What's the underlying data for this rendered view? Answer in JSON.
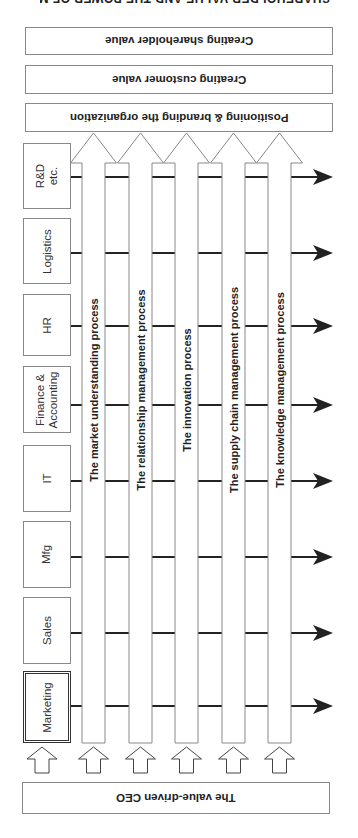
{
  "header_cut_text": "SHAREHOLDER VALUE AND THE POWER OF MARKETING",
  "goals": [
    {
      "label": "Creating shareholder value",
      "top": 27,
      "height": 28
    },
    {
      "label": "Creating customer value",
      "top": 65,
      "height": 29
    },
    {
      "label": "Positioning & branding the organization",
      "top": 103,
      "height": 29
    }
  ],
  "functions": [
    {
      "label": "R&D\netc.",
      "top": 143,
      "height": 66,
      "primary": false
    },
    {
      "label": "Logistics",
      "top": 218,
      "height": 66,
      "primary": false
    },
    {
      "label": "HR",
      "top": 294,
      "height": 62,
      "primary": false
    },
    {
      "label": "Finance &\nAccounting",
      "top": 366,
      "height": 67,
      "primary": false
    },
    {
      "label": "IT",
      "top": 445,
      "height": 67,
      "primary": false
    },
    {
      "label": "Mfg",
      "top": 521,
      "height": 67,
      "primary": false
    },
    {
      "label": "Sales",
      "top": 597,
      "height": 67,
      "primary": false
    },
    {
      "label": "Marketing",
      "top": 671,
      "height": 72,
      "primary": true
    }
  ],
  "processes": [
    {
      "label": "The market understanding process",
      "x": 82
    },
    {
      "label": "The relationship management process",
      "x": 129
    },
    {
      "label": "The innovation process",
      "x": 175
    },
    {
      "label": "The supply chain management process",
      "x": 222
    },
    {
      "label": "The knowledge management process",
      "x": 268
    }
  ],
  "flow_rows_y": [
    177,
    253,
    326,
    405,
    481,
    557,
    633,
    706
  ],
  "ceo": {
    "label": "The value-driven CEO"
  },
  "colors": {
    "line": "#222222",
    "border": "#888888",
    "background": "#ffffff"
  }
}
